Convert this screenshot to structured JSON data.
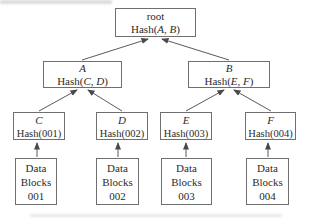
{
  "diagram_type": "merkle-tree",
  "tree": {
    "root": {
      "label": "root",
      "hash": {
        "prefix": "Hash(",
        "a": "A",
        "sep": ", ",
        "b": "B",
        "close": ")"
      }
    },
    "branches": [
      {
        "label": "A",
        "hash": {
          "prefix": "Hash(",
          "a": "C",
          "sep": ", ",
          "b": "D",
          "close": ")"
        }
      },
      {
        "label": "B",
        "hash": {
          "prefix": "Hash(",
          "a": "E",
          "sep": ", ",
          "b": "F",
          "close": ")"
        }
      }
    ],
    "leaves": [
      {
        "label": "C",
        "hash": "Hash(001)"
      },
      {
        "label": "D",
        "hash": "Hash(002)"
      },
      {
        "label": "E",
        "hash": "Hash(003)"
      },
      {
        "label": "F",
        "hash": "Hash(004)"
      }
    ],
    "data_blocks": [
      {
        "line1": "Data",
        "line2": "Blocks",
        "line3": "001"
      },
      {
        "line1": "Data",
        "line2": "Blocks",
        "line3": "002"
      },
      {
        "line1": "Data",
        "line2": "Blocks",
        "line3": "003"
      },
      {
        "line1": "Data",
        "line2": "Blocks",
        "line3": "004"
      }
    ]
  },
  "colors": {
    "background": "#ffffff",
    "box_border": "#6f6f6f",
    "text": "#2b2b2b",
    "arrow": "#4a4a4a"
  }
}
